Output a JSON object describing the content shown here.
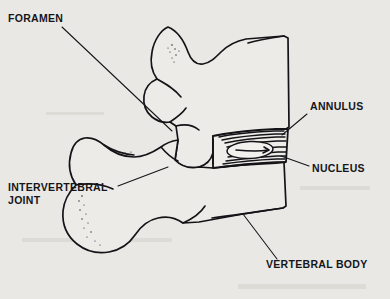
{
  "figure": {
    "background_color": "#e9e8e4",
    "ink_color": "#141418",
    "view": "lateral sagittal section of two adjacent vertebrae"
  },
  "labels": [
    {
      "id": "foramen",
      "text": "FORAMEN",
      "x": 8,
      "y": 22,
      "anchor": "start",
      "leader": "M 62 27 L 172 131",
      "points_to": "intervertebral foramen / spinal canal opening"
    },
    {
      "id": "annulus",
      "text": "ANNULUS",
      "x": 310,
      "y": 110,
      "anchor": "start",
      "leader": "M 307 114 L 282 135",
      "points_to": "annulus fibrosus concentric rings"
    },
    {
      "id": "nucleus",
      "text": "NUCLEUS",
      "x": 312,
      "y": 172,
      "anchor": "start",
      "leader": "M 309 166 L 281 156",
      "points_to": "nucleus pulposus"
    },
    {
      "id": "intervertebral-joint",
      "text": "INTERVERTEBRAL",
      "text_line2": "JOINT",
      "x": 8,
      "y": 191,
      "anchor": "start",
      "leader": "M 118 186 L 168 167",
      "points_to": "facet / zygapophyseal joint"
    },
    {
      "id": "vertebral-body",
      "text": "VERTEBRAL BODY",
      "x": 266,
      "y": 268,
      "anchor": "start",
      "leader": "M 277 259 L 243 214",
      "points_to": "lower vertebral body"
    }
  ],
  "anatomy": {
    "upper_vertebra": {
      "name": "upper vertebra",
      "parts": [
        "spinous process",
        "lamina",
        "pedicle",
        "vertebral body",
        "inferior articular process"
      ]
    },
    "lower_vertebra": {
      "name": "lower vertebra",
      "parts": [
        "spinous process",
        "lamina",
        "superior articular process",
        "vertebral body"
      ]
    },
    "disc": {
      "name": "intervertebral disc",
      "annulus_rings": 9,
      "nucleus_shape": "oval"
    }
  }
}
